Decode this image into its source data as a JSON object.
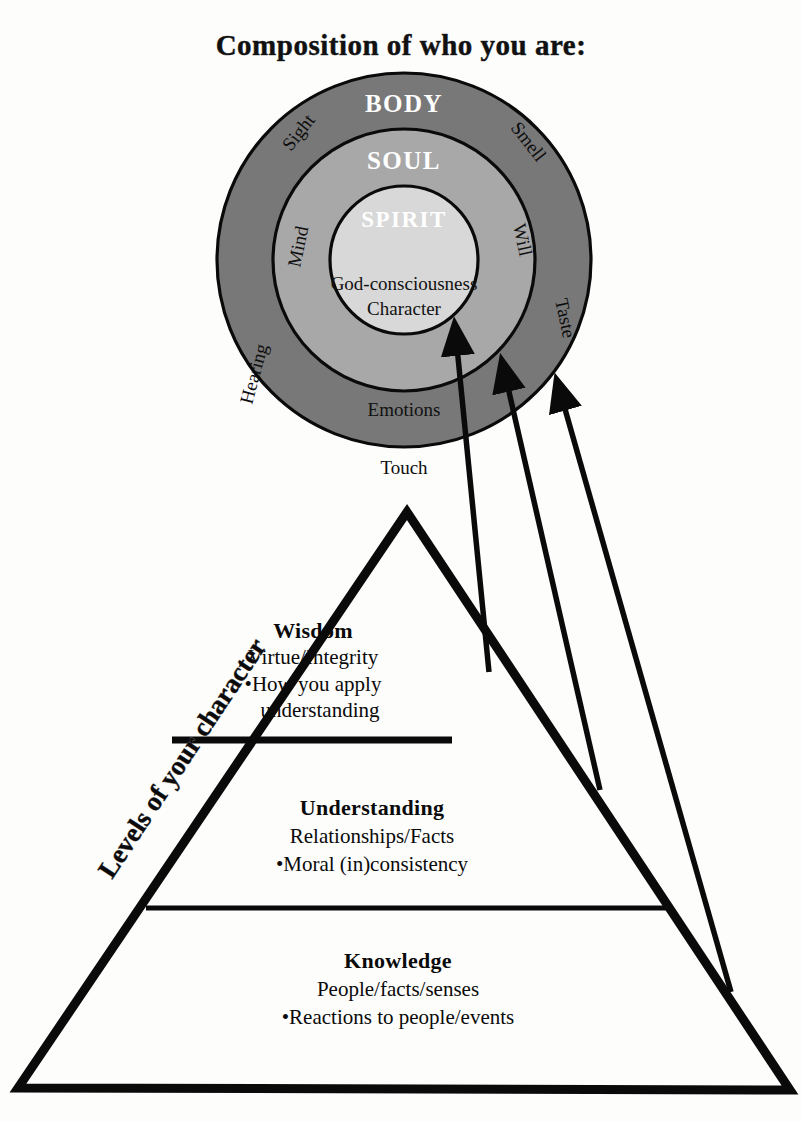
{
  "title": "Composition of who you are:",
  "circles": {
    "outer": {
      "label": "BODY",
      "color": "#787878"
    },
    "middle": {
      "label": "SOUL",
      "color": "#a8a8a8"
    },
    "inner": {
      "label": "SPIRIT",
      "color": "#d8d8d8"
    },
    "core_lines": [
      "God-consciousness",
      "Character"
    ],
    "body_senses": [
      "Sight",
      "Smell",
      "Hearing",
      "Taste",
      "Touch"
    ],
    "soul_faculties": [
      "Mind",
      "Will",
      "Emotions"
    ]
  },
  "pyramid": {
    "side_label": "Levels of your character",
    "tiers": [
      {
        "name": "Wisdom",
        "subtitle": "Virtue/Integrity",
        "bullet": "•How you apply",
        "bullet_cont": "understanding"
      },
      {
        "name": "Understanding",
        "subtitle": "Relationships/Facts",
        "bullet": "•Moral (in)consistency",
        "bullet_cont": ""
      },
      {
        "name": "Knowledge",
        "subtitle": "People/facts/senses",
        "bullet": "•Reactions to people/events",
        "bullet_cont": ""
      }
    ]
  },
  "colors": {
    "ink": "#0a0a0a",
    "background": "#fdfdfc",
    "body_gray": "#787878",
    "soul_gray": "#a8a8a8",
    "spirit_gray": "#d8d8d8"
  }
}
